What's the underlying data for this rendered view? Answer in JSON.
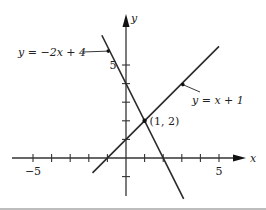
{
  "chart_data": {
    "type": "line",
    "title": "",
    "xlabel": "x",
    "ylabel": "y",
    "xlim": [
      -6,
      6.5
    ],
    "ylim": [
      -3,
      7.5
    ],
    "x_tick_values": [
      -5,
      -4,
      -3,
      -2,
      -1,
      1,
      2,
      3,
      4,
      5
    ],
    "y_tick_values": [
      -1,
      1,
      2,
      3,
      4,
      5
    ],
    "x_tick_labels": [
      {
        "value": -5,
        "label": "−5"
      },
      {
        "value": 5,
        "label": "5"
      }
    ],
    "y_tick_labels": [
      {
        "value": 5,
        "label": "5"
      }
    ],
    "grid": false,
    "series": [
      {
        "name": "y = −2x + 4",
        "slope": -2,
        "intercept": 4,
        "x_range": [
          -1.3,
          3.1
        ],
        "label_anchor": [
          -0.9,
          5.8
        ]
      },
      {
        "name": "y = x + 1",
        "slope": 1,
        "intercept": 1,
        "x_range": [
          -1.8,
          5.0
        ],
        "label_anchor": [
          3.0,
          4.0
        ]
      }
    ],
    "annotations": [
      {
        "text": "(1, 2)",
        "x": 1,
        "y": 2,
        "type": "point"
      }
    ]
  },
  "labels": {
    "line1": "y = −2x + 4",
    "line2": "y = x + 1",
    "intersection": "(1, 2)",
    "x_axis": "x",
    "y_axis": "y"
  }
}
